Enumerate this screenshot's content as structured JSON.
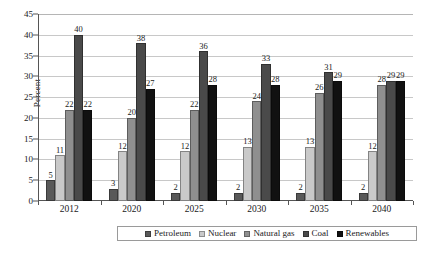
{
  "chart_data": {
    "type": "bar",
    "title": "",
    "xlabel": "",
    "ylabel": "Percent",
    "ylim": [
      0,
      45
    ],
    "ytick_step": 5,
    "yticks": [
      "0",
      "5",
      "10",
      "15",
      "20",
      "25",
      "30",
      "35",
      "40",
      "45"
    ],
    "grid": true,
    "legend_position": "bottom",
    "categories": [
      "2012",
      "2020",
      "2025",
      "2030",
      "2035",
      "2040"
    ],
    "series": [
      {
        "name": "Petroleum",
        "color": "#595959",
        "values": [
          5,
          3,
          2,
          2,
          2,
          2
        ]
      },
      {
        "name": "Nuclear",
        "color": "#c9c9c9",
        "values": [
          11,
          12,
          12,
          13,
          13,
          12
        ]
      },
      {
        "name": "Natural gas",
        "color": "#8f8f8f",
        "values": [
          22,
          20,
          22,
          24,
          26,
          28
        ]
      },
      {
        "name": "Coal",
        "color": "#4a4a4a",
        "values": [
          40,
          38,
          36,
          33,
          31,
          29
        ]
      },
      {
        "name": "Renewables",
        "color": "#111111",
        "values": [
          22,
          27,
          28,
          28,
          29,
          29
        ]
      }
    ]
  },
  "colors": {
    "axis": "#555555",
    "gridline": "#c8c8c8",
    "text": "#1a1a1a",
    "legend_border": "#9a9a9a",
    "background": "#ffffff"
  }
}
